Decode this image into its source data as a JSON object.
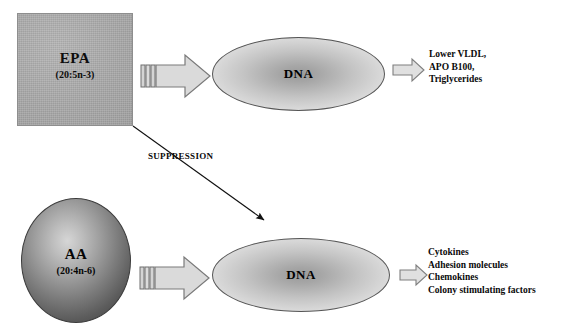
{
  "diagram": {
    "colors": {
      "epa_box_fill": "#a9a9a9",
      "aa_circle_edge": "#474747",
      "aa_circle_center": "#d6d6d6",
      "dna_fill_center": "#9a9a9a",
      "dna_fill_edge": "#e6e6e6",
      "arrow_fill": "#d9d9d9",
      "arrow_stroke": "#7a7a7a",
      "text": "#0a0a0a",
      "background": "#ffffff"
    }
  },
  "epa_node": {
    "title": "EPA",
    "subtitle": "(20:5n-3)",
    "shape": "square"
  },
  "aa_node": {
    "title": "AA",
    "subtitle": "(20:4n-6)",
    "shape": "circle"
  },
  "dna_top": {
    "label": "DNA",
    "shape": "ellipse"
  },
  "dna_bottom": {
    "label": "DNA",
    "shape": "ellipse"
  },
  "suppression": {
    "label": "SUPPRESSION",
    "from": "EPA box (bottom-right corner)",
    "to": "lower DNA ellipse"
  },
  "outcomes_top": {
    "lines": [
      "Lower VLDL,",
      "APO B100,",
      "Triglycerides"
    ]
  },
  "outcomes_bottom": {
    "lines": [
      "Cytokines",
      "Adhesion molecules",
      "Chemokines",
      "Colony stimulating factors"
    ]
  }
}
